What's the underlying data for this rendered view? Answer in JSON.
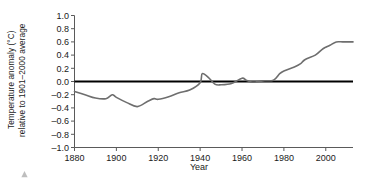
{
  "chart_data": {
    "type": "line",
    "title": "",
    "xlabel": "Year",
    "ylabel_line1": "Temperature anomaly (°C)",
    "ylabel_line2": "relative to 1901–2000 average",
    "xlim": [
      1880,
      2013
    ],
    "ylim": [
      -1.0,
      1.0
    ],
    "grid": false,
    "legend": "none",
    "xticks": [
      1880,
      1900,
      1920,
      1940,
      1960,
      1980,
      2000
    ],
    "xticklabels": [
      "1880",
      "1900",
      "1920",
      "1940",
      "1960",
      "1980",
      "2000"
    ],
    "yticks": [
      1.0,
      0.8,
      0.6,
      0.4,
      0.2,
      0.0,
      -0.2,
      -0.4,
      -0.6,
      -0.8,
      -1.0
    ],
    "yticklabels": [
      "1.0",
      "0.8",
      "0.6",
      "0.4",
      "0.2",
      "0.0",
      "–0.2",
      "–0.4",
      "–0.6",
      "–0.8",
      "–1.0"
    ],
    "reference_line": {
      "value": 0.0,
      "color": "#000000",
      "width": 2.0,
      "label": "1901–2000 average"
    },
    "series": [
      {
        "name": "Global temperature anomaly",
        "color": "#6e6e6e",
        "x": [
          1880,
          1885,
          1890,
          1895,
          1898,
          1900,
          1905,
          1910,
          1915,
          1918,
          1920,
          1925,
          1930,
          1935,
          1940,
          1941,
          1944,
          1947,
          1950,
          1955,
          1960,
          1962,
          1965,
          1970,
          1975,
          1978,
          1980,
          1985,
          1988,
          1990,
          1995,
          1998,
          2000,
          2002,
          2005,
          2008,
          2010,
          2013
        ],
        "values": [
          -0.15,
          -0.2,
          -0.25,
          -0.26,
          -0.2,
          -0.24,
          -0.32,
          -0.38,
          -0.3,
          -0.26,
          -0.27,
          -0.23,
          -0.17,
          -0.13,
          -0.02,
          0.12,
          0.06,
          -0.04,
          -0.05,
          -0.03,
          0.05,
          0.02,
          -0.01,
          0.01,
          0.02,
          0.12,
          0.16,
          0.22,
          0.27,
          0.33,
          0.4,
          0.48,
          0.52,
          0.55,
          0.6,
          0.6,
          0.6,
          0.6
        ]
      }
    ]
  },
  "axes": {
    "xlabel": "Year"
  },
  "colors": {
    "series": "#6e6e6e",
    "reference": "#000000",
    "axis": "#5a5a5a",
    "text": "#1a1a1a",
    "background": "#ffffff"
  }
}
